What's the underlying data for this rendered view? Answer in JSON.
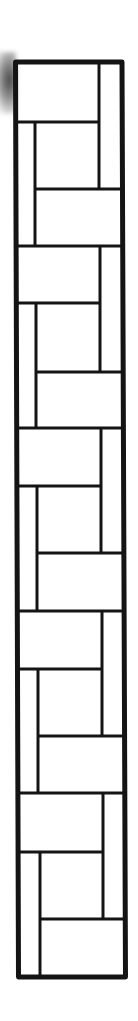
{
  "drawing": {
    "title": "",
    "stroke_color": "#141414",
    "background_color": "#ffffff",
    "frame": {
      "top_left": [
        15.5,
        62
      ],
      "top_right": [
        122,
        62
      ],
      "bottom_right": [
        125.5,
        977
      ],
      "bottom_left": [
        18.5,
        977
      ],
      "stroke_width": 5
    },
    "inner_lines": {
      "stroke_width": 3,
      "horizontal": [
        {
          "y": 122,
          "x1": 16,
          "x2": 99
        },
        {
          "y": 189,
          "x1": 35,
          "x2": 122
        },
        {
          "y": 246,
          "x1": 16,
          "x2": 123
        },
        {
          "y": 303,
          "x1": 17,
          "x2": 100
        },
        {
          "y": 372,
          "x1": 36,
          "x2": 123
        },
        {
          "y": 428,
          "x1": 17,
          "x2": 123
        },
        {
          "y": 486,
          "x1": 17,
          "x2": 101
        },
        {
          "y": 553,
          "x1": 37,
          "x2": 124
        },
        {
          "y": 611,
          "x1": 17,
          "x2": 124
        },
        {
          "y": 669,
          "x1": 18,
          "x2": 102
        },
        {
          "y": 736,
          "x1": 38,
          "x2": 124
        },
        {
          "y": 793,
          "x1": 18,
          "x2": 125
        },
        {
          "y": 852,
          "x1": 18,
          "x2": 103
        },
        {
          "y": 919,
          "x1": 39,
          "x2": 125
        }
      ],
      "vertical": [
        {
          "x": 99,
          "y1": 62,
          "y2": 189
        },
        {
          "x": 35,
          "y1": 122,
          "y2": 246
        },
        {
          "x": 100,
          "y1": 246,
          "y2": 372
        },
        {
          "x": 36,
          "y1": 303,
          "y2": 428
        },
        {
          "x": 101,
          "y1": 428,
          "y2": 553
        },
        {
          "x": 37,
          "y1": 486,
          "y2": 611
        },
        {
          "x": 102,
          "y1": 611,
          "y2": 736
        },
        {
          "x": 38,
          "y1": 669,
          "y2": 793
        },
        {
          "x": 103,
          "y1": 793,
          "y2": 919
        },
        {
          "x": 40,
          "y1": 852,
          "y2": 977
        }
      ]
    },
    "repeating_units": 5,
    "description": "Vertical strip of interlocking rectangles (pinwheel/basketweave tile pattern) inside a thick black frame"
  }
}
